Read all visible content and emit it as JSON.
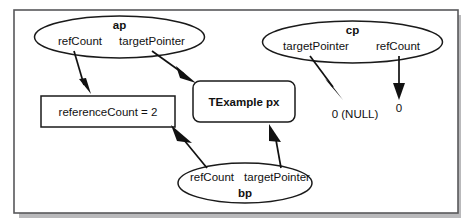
{
  "diagram": {
    "colors": {
      "stroke": "#1a1a1a",
      "frame": "#58585a",
      "background": "#ffffff",
      "arrow": "#111111"
    },
    "nodes": {
      "ap": {
        "name": "ap",
        "field_left": "refCount",
        "field_right": "targetPointer"
      },
      "cp": {
        "name": "cp",
        "field_left": "targetPointer",
        "field_right": "refCount"
      },
      "bp": {
        "name": "bp",
        "field_left": "refCount",
        "field_right": "targetPointer"
      },
      "reference_count_box": {
        "label": "referenceCount =  2"
      },
      "target_object_box": {
        "label": "TExample px"
      },
      "cp_target_value": {
        "label": "0 (NULL)"
      },
      "cp_refcount_value": {
        "label": "0"
      }
    }
  }
}
